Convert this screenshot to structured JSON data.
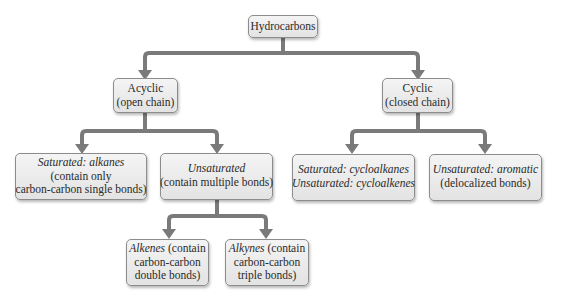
{
  "diagram": {
    "type": "tree",
    "root": {
      "label": "Hydrocarbons"
    },
    "acyclic": {
      "line1": "Acyclic",
      "line2": "(open chain)"
    },
    "cyclic": {
      "line1": "Cyclic",
      "line2": "(closed chain)"
    },
    "saturated_alkanes": {
      "line1": "Saturated: alkanes",
      "line2": "(contain only",
      "line3": "carbon-carbon single bonds)"
    },
    "unsaturated": {
      "line1": "Unsaturated",
      "line2": "(contain multiple bonds)"
    },
    "cyclo": {
      "line1": "Saturated: cycloalkanes",
      "line2": "Unsaturated: cycloalkenes"
    },
    "aromatic": {
      "line1": "Unsaturated: aromatic",
      "line2": "(delocalized bonds)"
    },
    "alkenes": {
      "name": "Alkenes",
      "line1_rest": " (contain",
      "line2": "carbon-carbon",
      "line3": "double bonds)"
    },
    "alkynes": {
      "name": "Alkynes",
      "line1_rest": " (contain",
      "line2": "carbon-carbon",
      "line3": "triple bonds)"
    },
    "colors": {
      "connector": "#7a7a7a",
      "box_border": "#8c8c8c",
      "box_fill": "#ebebeb"
    }
  }
}
